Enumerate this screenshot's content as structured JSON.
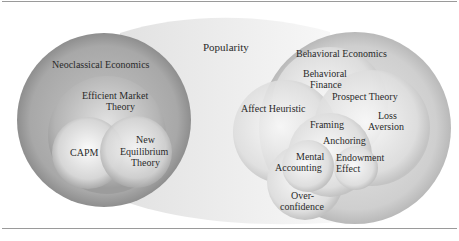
{
  "diagram": {
    "top_label": "Popularity",
    "left_group": {
      "outer": "Neoclassical Economics",
      "middle": [
        "Efficient Market",
        "Theory"
      ],
      "inner_left": "CAPM",
      "inner_right": [
        "New",
        "Equilibrium",
        "Theory"
      ]
    },
    "right_group": {
      "outer": "Behavioral Economics",
      "behavioral_finance": [
        "Behavioral",
        "Finance"
      ],
      "prospect_theory": "Prospect Theory",
      "affect_heuristic": "Affect Heuristic",
      "loss_aversion": [
        "Loss",
        "Aversion"
      ],
      "framing": "Framing",
      "anchoring": "Anchoring",
      "mental_accounting": [
        "Mental",
        "Accounting"
      ],
      "endowment_effect": [
        "Endowment",
        "Effect"
      ],
      "overconfidence": [
        "Over-",
        "confidence"
      ]
    }
  }
}
